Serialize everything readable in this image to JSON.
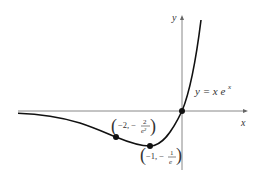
{
  "figure": {
    "function_label": "y = x e",
    "function_exponent": "x",
    "x_axis_label": "x",
    "y_axis_label": "y",
    "points": [
      {
        "name": "origin",
        "x": 0,
        "y": 0
      },
      {
        "name": "minimum",
        "x": -1,
        "y": "-1/e",
        "label_left": "−1, −",
        "label_num": "1",
        "label_den": "e"
      },
      {
        "name": "inflection",
        "x": -2,
        "y": "-2/e^2",
        "label_left": "−2, −",
        "label_num": "2",
        "label_den": "e²"
      }
    ]
  },
  "colors": {
    "curve": "#111111",
    "axis": "#888888",
    "text": "#333333"
  }
}
